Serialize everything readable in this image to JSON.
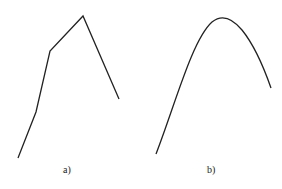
{
  "panels": [
    {
      "label": "a)",
      "kind": "polyline",
      "points": [
        [
          18,
          158
        ],
        [
          36,
          112
        ],
        [
          50,
          51
        ],
        [
          83,
          16
        ],
        [
          119,
          99
        ]
      ]
    },
    {
      "label": "b)",
      "kind": "curve",
      "start": [
        156,
        154
      ],
      "peak": [
        218,
        19
      ],
      "end": [
        271,
        88
      ]
    }
  ],
  "colors": {
    "line": "#222222",
    "background": "#ffffff"
  }
}
